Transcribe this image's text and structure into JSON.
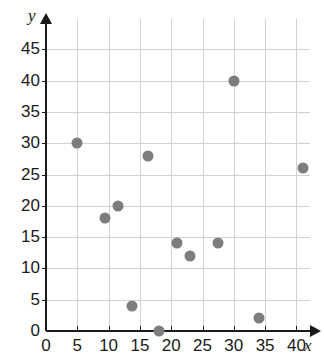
{
  "chart_data": {
    "type": "scatter",
    "title": "",
    "xlabel": "x",
    "ylabel": "y",
    "xlim": [
      0,
      42
    ],
    "ylim": [
      0,
      48
    ],
    "grid": true,
    "legend": false,
    "x_ticks": [
      0,
      5,
      10,
      15,
      20,
      25,
      30,
      35,
      40
    ],
    "y_ticks": [
      0,
      5,
      10,
      15,
      20,
      25,
      30,
      35,
      40,
      45
    ],
    "x_tick_labels": [
      "0",
      "5",
      "10",
      "15",
      "20",
      "25",
      "30",
      "35",
      "40"
    ],
    "y_tick_labels": [
      "0",
      "5",
      "10",
      "15",
      "20",
      "25",
      "30",
      "35",
      "40",
      "45"
    ],
    "marker_color": "#7d7d7d",
    "grid_color": "#d2d2d2",
    "axis_color": "#1a1a1a",
    "points": [
      {
        "x": 5,
        "y": 30
      },
      {
        "x": 9.5,
        "y": 18
      },
      {
        "x": 11.5,
        "y": 20
      },
      {
        "x": 13.8,
        "y": 4
      },
      {
        "x": 16.3,
        "y": 28
      },
      {
        "x": 18,
        "y": 0
      },
      {
        "x": 21,
        "y": 14
      },
      {
        "x": 23,
        "y": 12
      },
      {
        "x": 27.5,
        "y": 14
      },
      {
        "x": 30,
        "y": 40
      },
      {
        "x": 34,
        "y": 2
      },
      {
        "x": 41,
        "y": 26
      }
    ]
  }
}
